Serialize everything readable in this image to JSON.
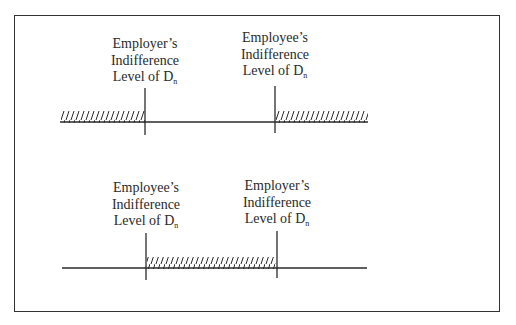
{
  "diagram": {
    "top_panel": {
      "left_marker": {
        "line1": "Employer’s",
        "line2": "Indifference",
        "line3_prefix": "Level of D",
        "line3_sub": "n"
      },
      "right_marker": {
        "line1": "Employee’s",
        "line2": "Indifference",
        "line3_prefix": "Level of D",
        "line3_sub": "n"
      },
      "hatched_regions": [
        "left of Employer’s indifference level",
        "right of Employee’s indifference level"
      ]
    },
    "bottom_panel": {
      "left_marker": {
        "line1": "Employee’s",
        "line2": "Indifference",
        "line3_prefix": "Level of D",
        "line3_sub": "n"
      },
      "right_marker": {
        "line1": "Employer’s",
        "line2": "Indifference",
        "line3_prefix": "Level of D",
        "line3_sub": "n"
      },
      "hatched_regions": [
        "between Employee’s and Employer’s indifference levels"
      ]
    }
  },
  "colors": {
    "ink": "#2a2a2a",
    "background": "#ffffff"
  }
}
